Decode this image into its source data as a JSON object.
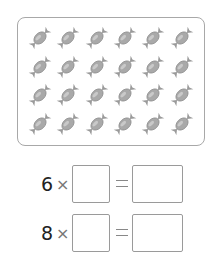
{
  "picture": {
    "item_icon": "wrapped-candy-icon",
    "rows": 4,
    "columns": 6,
    "frame_color": "#a8a8a8",
    "candy_color": "#a9a9a9"
  },
  "equations": [
    {
      "multiplier": "6",
      "operator": "×",
      "equals": "=",
      "factor_answer": "",
      "product_answer": ""
    },
    {
      "multiplier": "8",
      "operator": "×",
      "equals": "=",
      "factor_answer": "",
      "product_answer": ""
    }
  ]
}
